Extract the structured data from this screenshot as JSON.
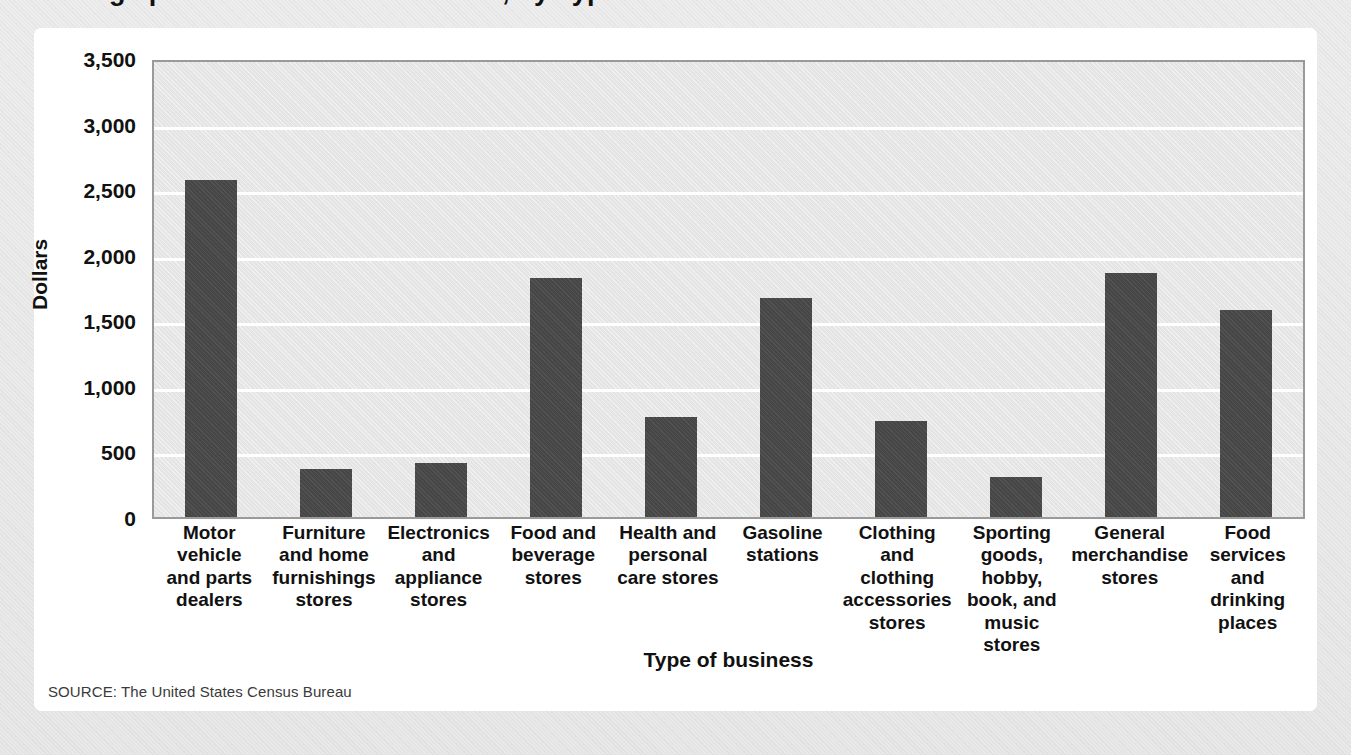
{
  "title": "Average per Household Retail Sales, by Type of Business",
  "card": {
    "source": "SOURCE: The United States Census Bureau"
  },
  "colors": {
    "bar": "#4a4a4a",
    "plot_background": "#e4e4e4",
    "gridline": "#ffffff",
    "plot_border": "#9a9a9a",
    "card_background": "#ffffff",
    "page_background": "#ebebeb",
    "text": "#111111"
  },
  "chart_data": {
    "type": "bar",
    "title": "Average per Household Retail Sales, by Type of Business",
    "xlabel": "Type of business",
    "ylabel": "Dollars",
    "ylim": [
      0,
      3500
    ],
    "ytick_step": 500,
    "ytick_labels": [
      "3,500",
      "3,000",
      "2,500",
      "2,000",
      "1,500",
      "1,000",
      "500",
      "0"
    ],
    "ytick_values": [
      3500,
      3000,
      2500,
      2000,
      1500,
      1000,
      500,
      0
    ],
    "grid": true,
    "legend": "none",
    "categories": [
      "Motor vehicle and parts dealers",
      "Furniture and home furnishings stores",
      "Electronics and appliance stores",
      "Food and beverage stores",
      "Health and personal care stores",
      "Gasoline stations",
      "Clothing and clothing accessories stores",
      "Sporting goods, hobby, book, and music stores",
      "General merchandise stores",
      "Food services and drinking places"
    ],
    "category_lines": [
      [
        "Motor",
        "vehicle",
        "and parts",
        "dealers"
      ],
      [
        "Furniture",
        "and home",
        "furnishings",
        "stores"
      ],
      [
        "Electronics",
        "and",
        "appliance",
        "stores"
      ],
      [
        "Food and",
        "beverage",
        "stores"
      ],
      [
        "Health and",
        "personal",
        "care stores"
      ],
      [
        "Gasoline",
        "stations"
      ],
      [
        "Clothing",
        "and",
        "clothing",
        "accessories",
        "stores"
      ],
      [
        "Sporting",
        "goods,",
        "hobby,",
        "book, and",
        "music",
        "stores"
      ],
      [
        "General",
        "merchandise",
        "stores"
      ],
      [
        "Food",
        "services",
        "and",
        "drinking",
        "places"
      ]
    ],
    "values": [
      2570,
      365,
      410,
      1825,
      760,
      1670,
      730,
      305,
      1860,
      1575
    ]
  }
}
